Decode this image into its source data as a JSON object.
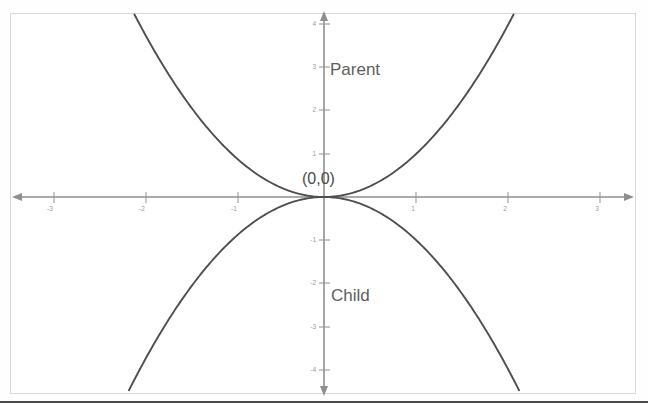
{
  "figure": {
    "background_color": "#ffffff",
    "frame_color": "#d8d8d8",
    "curve_color": "#4f4f4f",
    "axis_color": "#8f8f8f",
    "label_color": "#5e5e5e"
  },
  "annotations": {
    "parent_label": "Parent",
    "child_label": "Child",
    "origin_label": "(0,0)"
  },
  "chart_data": {
    "type": "line",
    "title": "",
    "subtitle": "",
    "xlabel": "",
    "ylabel": "",
    "xlim": [
      -3.4,
      3.4
    ],
    "ylim": [
      -4.3,
      4.3
    ],
    "grid": false,
    "legend_position": "in-plot-annotations",
    "xticks": [
      -3,
      -2,
      -1,
      1,
      2,
      3
    ],
    "xticklabels": [
      "-3",
      "-2",
      "-1",
      "1",
      "2",
      "3"
    ],
    "yticks": [
      -4,
      -3,
      -2,
      -1,
      1,
      2,
      3,
      4
    ],
    "yticklabels": [
      "-4",
      "-3",
      "-2",
      "-1",
      "1",
      "2",
      "3",
      "4"
    ],
    "axes_style": "arrowed-cartesian-cross",
    "annotations": [
      {
        "text": "Parent",
        "x": 0.15,
        "y": 3.1
      },
      {
        "text": "Child",
        "x": 0.15,
        "y": -2.4
      },
      {
        "text": "(0,0)",
        "x": -0.25,
        "y": 0.45
      }
    ],
    "series": [
      {
        "name": "Parent",
        "equation": "y = x^2",
        "x": [
          -2.1,
          -1.8,
          -1.5,
          -1.2,
          -0.9,
          -0.6,
          -0.3,
          0,
          0.3,
          0.6,
          0.9,
          1.2,
          1.5,
          1.8,
          2.1
        ],
        "values": [
          4.41,
          3.24,
          2.25,
          1.44,
          0.81,
          0.36,
          0.09,
          0,
          0.09,
          0.36,
          0.81,
          1.44,
          2.25,
          3.24,
          4.41
        ]
      },
      {
        "name": "Child",
        "equation": "y = -x^2",
        "x": [
          -2.1,
          -1.8,
          -1.5,
          -1.2,
          -0.9,
          -0.6,
          -0.3,
          0,
          0.3,
          0.6,
          0.9,
          1.2,
          1.5,
          1.8,
          2.1
        ],
        "values": [
          -4.41,
          -3.24,
          -2.25,
          -1.44,
          -0.81,
          -0.36,
          -0.09,
          0,
          -0.09,
          -0.36,
          -0.81,
          -1.44,
          -2.25,
          -3.24,
          -4.41
        ]
      }
    ]
  }
}
